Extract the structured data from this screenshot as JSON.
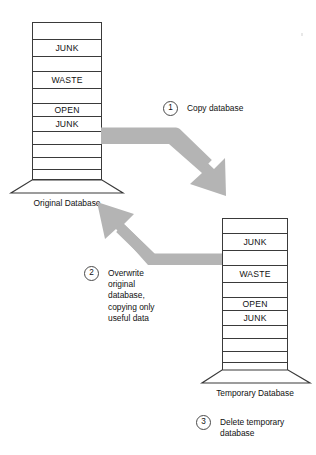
{
  "diagram": {
    "arrow_color": "#b0b0b0",
    "outline_color": "#3a3a3a",
    "text_color": "#111111"
  },
  "original_database": {
    "label": "Original Database",
    "segments": [
      {
        "text": ""
      },
      {
        "text": "JUNK"
      },
      {
        "text": ""
      },
      {
        "text": "WASTE"
      },
      {
        "text": ""
      },
      {
        "text": "OPEN"
      },
      {
        "text": "JUNK"
      },
      {
        "text": ""
      },
      {
        "text": ""
      },
      {
        "text": ""
      },
      {
        "text": ""
      }
    ]
  },
  "temporary_database": {
    "label": "Temporary Database",
    "segments": [
      {
        "text": ""
      },
      {
        "text": "JUNK"
      },
      {
        "text": ""
      },
      {
        "text": "WASTE"
      },
      {
        "text": ""
      },
      {
        "text": "OPEN"
      },
      {
        "text": "JUNK"
      },
      {
        "text": ""
      },
      {
        "text": ""
      },
      {
        "text": ""
      },
      {
        "text": ""
      }
    ]
  },
  "steps": [
    {
      "number": "1",
      "text": "Copy database"
    },
    {
      "number": "2",
      "text": "Overwrite\noriginal\ndatabase,\ncopying only\nuseful data"
    },
    {
      "number": "3",
      "text": "Delete temporary\ndatabase"
    }
  ],
  "arrows": [
    {
      "name": "copy-arrow",
      "from": "Original Database",
      "to": "Temporary Database"
    },
    {
      "name": "overwrite-arrow",
      "from": "Temporary Database",
      "to": "Original Database"
    }
  ]
}
